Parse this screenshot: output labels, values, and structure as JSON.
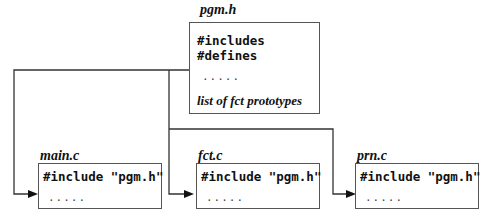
{
  "header_file": {
    "name": "pgm.h",
    "lines": [
      "#includes",
      "#defines"
    ],
    "ellipsis": ".....",
    "prototypes": "list of fct prototypes"
  },
  "source_files": [
    {
      "name": "main.c",
      "include": "#include \"pgm.h\"",
      "ellipsis": "....."
    },
    {
      "name": "fct.c",
      "include": "#include \"pgm.h\"",
      "ellipsis": "....."
    },
    {
      "name": "prn.c",
      "include": "#include \"pgm.h\"",
      "ellipsis": "....."
    }
  ]
}
